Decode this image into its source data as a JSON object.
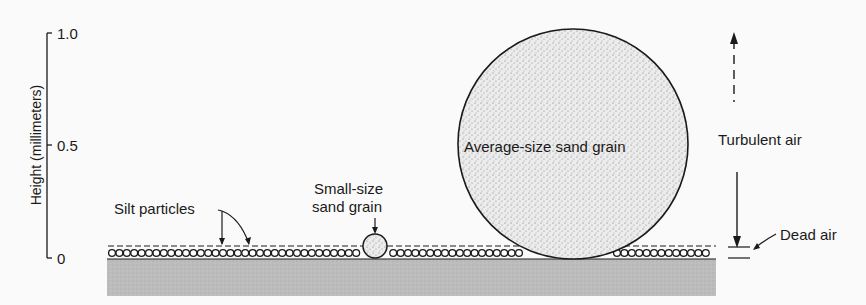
{
  "axis": {
    "label": "Height (millimeters)",
    "ticks": [
      {
        "value": "1.0",
        "y": 33
      },
      {
        "value": "0.5",
        "y": 145
      },
      {
        "value": "0",
        "y": 258
      }
    ]
  },
  "labels": {
    "silt": "Silt particles",
    "small_grain_line1": "Small-size",
    "small_grain_line2": "sand grain",
    "average_grain": "Average-size sand grain",
    "turbulent_air": "Turbulent air",
    "dead_air": "Dead air"
  },
  "colors": {
    "background": "#fafafa",
    "ground": "#b9b9b9",
    "ink": "#1a1a1a",
    "grain_fill": "#e6e6e6"
  },
  "chart_data": {
    "type": "diagram",
    "title": "",
    "ylabel": "Height (millimeters)",
    "ylim": [
      0,
      1.0
    ],
    "yticks": [
      0,
      0.5,
      1.0
    ],
    "elements": [
      {
        "name": "Silt particles",
        "approx_height_mm": 0.03
      },
      {
        "name": "Small-size sand grain",
        "approx_height_mm": 0.1
      },
      {
        "name": "Average-size sand grain",
        "approx_height_mm": 1.0
      },
      {
        "name": "Dead air",
        "approx_height_mm": 0.04
      },
      {
        "name": "Turbulent air",
        "approx_height_mm": "above dead air layer"
      }
    ]
  }
}
